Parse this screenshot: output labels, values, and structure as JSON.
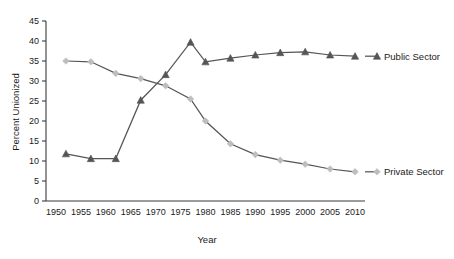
{
  "chart_data": {
    "type": "line",
    "title": "",
    "xlabel": "Year",
    "ylabel": "Percent Unionized",
    "xlim": [
      1948,
      2012
    ],
    "ylim": [
      0,
      45
    ],
    "ytick_labels": [
      "0",
      "5",
      "10",
      "15",
      "20",
      "25",
      "30",
      "35",
      "40",
      "45"
    ],
    "yticks": [
      0,
      5,
      10,
      15,
      20,
      25,
      30,
      35,
      40,
      45
    ],
    "xtick_labels": [
      "1950",
      "1955",
      "1960",
      "1965",
      "1970",
      "1975",
      "1980",
      "1985",
      "1990",
      "1995",
      "2000",
      "2005",
      "2010"
    ],
    "xticks": [
      1950,
      1955,
      1960,
      1965,
      1970,
      1975,
      1980,
      1985,
      1990,
      1995,
      2000,
      2005,
      2010
    ],
    "grid": false,
    "legend_position": "right-inline",
    "x": [
      1952,
      1957,
      1962,
      1967,
      1972,
      1977,
      1980,
      1985,
      1990,
      1995,
      2000,
      2005,
      2010
    ],
    "series": [
      {
        "name": "Public Sector",
        "label": "Public Sector",
        "color": "#555555",
        "marker": "triangle",
        "marker_color": "#555555",
        "values": [
          11.8,
          10.6,
          10.6,
          25.2,
          31.6,
          39.7,
          34.8,
          35.7,
          36.5,
          37.1,
          37.3,
          36.5,
          36.2
        ]
      },
      {
        "name": "Private Sector",
        "label": "Private Sector",
        "color": "#555555",
        "marker": "diamond",
        "marker_color": "#bdbdbd",
        "values": [
          35.0,
          34.8,
          31.9,
          30.6,
          28.8,
          25.5,
          20.0,
          14.3,
          11.6,
          10.2,
          9.2,
          8.0,
          7.3
        ]
      }
    ]
  }
}
